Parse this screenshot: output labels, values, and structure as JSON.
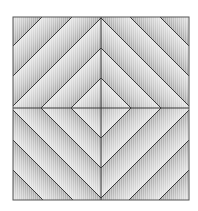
{
  "figure": {
    "frame": {
      "x": 13,
      "y": 17,
      "width": 176,
      "height": 183
    },
    "center": {
      "x": 101,
      "y": 108
    },
    "diamond_radii": [
      30,
      60,
      90,
      120,
      150,
      180
    ],
    "quadrants": [
      "top-left",
      "top-right",
      "bottom-left",
      "bottom-right"
    ],
    "colors": {
      "background": "#ffffff",
      "line": "#3a3a3a",
      "band_light": "#e4e4e4",
      "band_dark": "#a9a9a9",
      "hatch": "#cfcfcf"
    }
  }
}
